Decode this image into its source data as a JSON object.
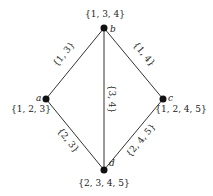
{
  "diagram": {
    "type": "graph",
    "nodes": [
      {
        "id": "b",
        "name": "b",
        "set": "{1, 3, 4}",
        "x": 104,
        "y": 28
      },
      {
        "id": "a",
        "name": "a",
        "set": "{1, 2, 3}",
        "x": 46,
        "y": 99
      },
      {
        "id": "c",
        "name": "c",
        "set": "{1, 2, 4, 5}",
        "x": 163,
        "y": 99
      },
      {
        "id": "d",
        "name": "d",
        "set": "{2, 3, 4, 5}",
        "x": 104,
        "y": 170
      }
    ],
    "edges": [
      {
        "from": "b",
        "to": "a",
        "label": "{1, 3}"
      },
      {
        "from": "b",
        "to": "c",
        "label": "{1, 4}"
      },
      {
        "from": "b",
        "to": "d",
        "label": "{3, 4}"
      },
      {
        "from": "a",
        "to": "d",
        "label": "{2, 3}"
      },
      {
        "from": "c",
        "to": "d",
        "label": "{2, 4, 5}"
      }
    ]
  }
}
